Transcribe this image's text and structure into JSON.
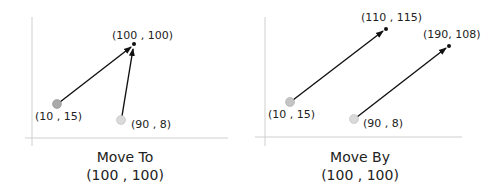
{
  "panels": [
    {
      "caption_line1": "Move To",
      "caption_line2": "(100 , 100)",
      "points": [
        {
          "label": "(10 , 15)",
          "color": "#a9a9a9"
        },
        {
          "label": "(90 , 8)",
          "color": "#d9d9d9"
        }
      ],
      "targets": [
        {
          "label": "(100 , 100)"
        }
      ]
    },
    {
      "caption_line1": "Move By",
      "caption_line2": "(100 , 100)",
      "points": [
        {
          "label": "(10 , 15)",
          "color": "#c4c4c4"
        },
        {
          "label": "(90 , 8)",
          "color": "#d9d9d9"
        }
      ],
      "targets": [
        {
          "label": "(110 , 115)"
        },
        {
          "label": "(190, 108)"
        }
      ]
    }
  ],
  "colors": {
    "axis": "#c8c8c8",
    "arrow": "#111111",
    "text": "#222222"
  }
}
